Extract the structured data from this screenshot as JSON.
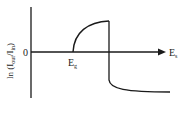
{
  "diagram": {
    "y_axis_label": {
      "main": "ln (I",
      "sub1": "out",
      "mid": "/I",
      "sub2": "in",
      "close": ")"
    },
    "origin_label": "0",
    "x_axis_label": {
      "main": "E",
      "sub": "s"
    },
    "threshold_label": {
      "main": "E",
      "sub": "g"
    },
    "colors": {
      "line": "#1a1a1a",
      "background": "#ffffff"
    }
  }
}
